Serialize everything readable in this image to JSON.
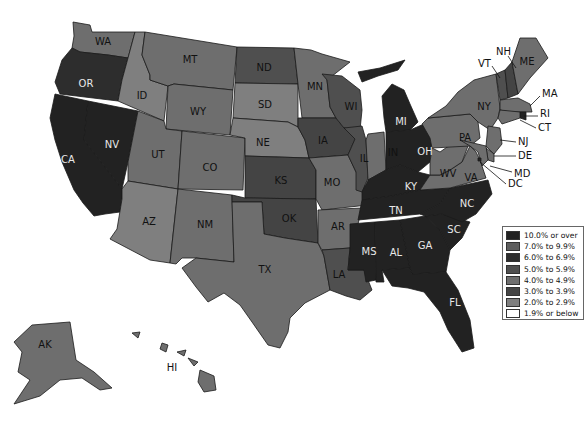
{
  "map": {
    "type": "choropleth",
    "region": "United States",
    "colors": {
      "c10": "#222222",
      "c7": "#5e5e5e",
      "c6": "#2d2d2d",
      "c5": "#4f4f4f",
      "c4": "#6e6e6e",
      "c3": "#444444",
      "c2": "#7f7f7f",
      "c1": "#ffffff"
    },
    "states": [
      {
        "id": "WA",
        "label": "WA",
        "bin": "c4"
      },
      {
        "id": "OR",
        "label": "OR",
        "bin": "c6"
      },
      {
        "id": "CA",
        "label": "CA",
        "bin": "c10"
      },
      {
        "id": "NV",
        "label": "NV",
        "bin": "c10"
      },
      {
        "id": "ID",
        "label": "ID",
        "bin": "c2"
      },
      {
        "id": "MT",
        "label": "MT",
        "bin": "c4"
      },
      {
        "id": "WY",
        "label": "WY",
        "bin": "c4"
      },
      {
        "id": "UT",
        "label": "UT",
        "bin": "c4"
      },
      {
        "id": "CO",
        "label": "CO",
        "bin": "c4"
      },
      {
        "id": "AZ",
        "label": "AZ",
        "bin": "c2"
      },
      {
        "id": "NM",
        "label": "NM",
        "bin": "c4"
      },
      {
        "id": "ND",
        "label": "ND",
        "bin": "c5"
      },
      {
        "id": "SD",
        "label": "SD",
        "bin": "c2"
      },
      {
        "id": "NE",
        "label": "NE",
        "bin": "c2"
      },
      {
        "id": "KS",
        "label": "KS",
        "bin": "c3"
      },
      {
        "id": "OK",
        "label": "OK",
        "bin": "c3"
      },
      {
        "id": "TX",
        "label": "TX",
        "bin": "c4"
      },
      {
        "id": "MN",
        "label": "MN",
        "bin": "c4"
      },
      {
        "id": "IA",
        "label": "IA",
        "bin": "c3"
      },
      {
        "id": "MO",
        "label": "MO",
        "bin": "c4"
      },
      {
        "id": "AR",
        "label": "AR",
        "bin": "c4"
      },
      {
        "id": "LA",
        "label": "LA",
        "bin": "c5"
      },
      {
        "id": "WI",
        "label": "WI",
        "bin": "c5"
      },
      {
        "id": "IL",
        "label": "IL",
        "bin": "c5"
      },
      {
        "id": "MI",
        "label": "MI",
        "bin": "c10"
      },
      {
        "id": "IN",
        "label": "IN",
        "bin": "c4"
      },
      {
        "id": "OH",
        "label": "OH",
        "bin": "c10"
      },
      {
        "id": "KY",
        "label": "KY",
        "bin": "c10"
      },
      {
        "id": "TN",
        "label": "TN",
        "bin": "c10"
      },
      {
        "id": "MS",
        "label": "MS",
        "bin": "c10"
      },
      {
        "id": "AL",
        "label": "AL",
        "bin": "c10"
      },
      {
        "id": "GA",
        "label": "GA",
        "bin": "c10"
      },
      {
        "id": "FL",
        "label": "FL",
        "bin": "c10"
      },
      {
        "id": "SC",
        "label": "SC",
        "bin": "c10"
      },
      {
        "id": "NC",
        "label": "NC",
        "bin": "c10"
      },
      {
        "id": "VA",
        "label": "VA",
        "bin": "c4"
      },
      {
        "id": "WV",
        "label": "WV",
        "bin": "c4"
      },
      {
        "id": "PA",
        "label": "PA",
        "bin": "c4"
      },
      {
        "id": "NY",
        "label": "NY",
        "bin": "c4"
      },
      {
        "id": "VT",
        "label": "VT",
        "bin": "c5"
      },
      {
        "id": "NH",
        "label": "NH",
        "bin": "c3"
      },
      {
        "id": "ME",
        "label": "ME",
        "bin": "c4"
      },
      {
        "id": "MA",
        "label": "MA",
        "bin": "c4"
      },
      {
        "id": "RI",
        "label": "RI",
        "bin": "c10"
      },
      {
        "id": "CT",
        "label": "CT",
        "bin": "c4"
      },
      {
        "id": "NJ",
        "label": "NJ",
        "bin": "c4"
      },
      {
        "id": "DE",
        "label": "DE",
        "bin": "c4"
      },
      {
        "id": "MD",
        "label": "MD",
        "bin": "c4"
      },
      {
        "id": "DC",
        "label": "DC",
        "bin": "c10"
      },
      {
        "id": "AK",
        "label": "AK",
        "bin": "c4"
      },
      {
        "id": "HI",
        "label": "HI",
        "bin": "c4"
      }
    ]
  },
  "legend": {
    "items": [
      {
        "key": "c10",
        "label": "10.0% or over"
      },
      {
        "key": "c7",
        "label": "7.0% to 9.9%"
      },
      {
        "key": "c6",
        "label": "6.0% to 6.9%"
      },
      {
        "key": "c5",
        "label": "5.0% to 5.9%"
      },
      {
        "key": "c4",
        "label": "4.0% to 4.9%"
      },
      {
        "key": "c3",
        "label": "3.0% to 3.9%"
      },
      {
        "key": "c2",
        "label": "2.0% to 2.9%"
      },
      {
        "key": "c1",
        "label": "1.9% or below"
      }
    ]
  }
}
